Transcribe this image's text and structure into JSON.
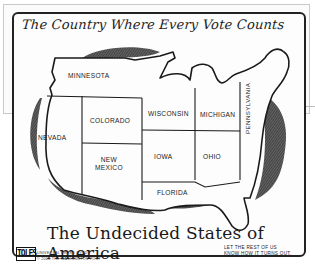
{
  "cartoon": {
    "title": "The Country Where Every Vote Counts",
    "subtitle": "The Undecided States of America",
    "states": [
      {
        "name": "MINNESOTA"
      },
      {
        "name": "COLORADO"
      },
      {
        "name": "NEVADA"
      },
      {
        "name": "WISCONSIN"
      },
      {
        "name": "MICHIGAN"
      },
      {
        "name": "NEW MEXICO",
        "line1": "NEW",
        "line2": "MEXICO"
      },
      {
        "name": "IOWA"
      },
      {
        "name": "OHIO"
      },
      {
        "name": "PENNSYLVANIA"
      },
      {
        "name": "FLORIDA"
      }
    ],
    "signature": "TOLES",
    "credit_line1": "UNIVERSAL PRESS SYND.",
    "credit_line2": "© 2004 THE WASHINGTON POST",
    "caption_line1": "LET THE REST OF US",
    "caption_line2": "KNOW HOW IT TURNS OUT.",
    "colors": {
      "ink": "#1c1c1c",
      "paper": "#fdfdfd",
      "background": "#ffffff"
    }
  }
}
